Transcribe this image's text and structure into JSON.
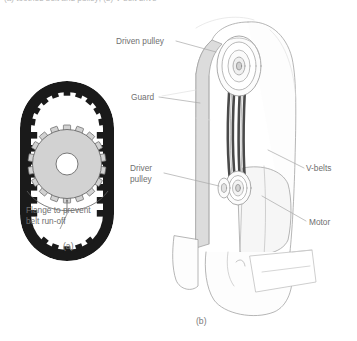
{
  "figure": {
    "top_caption": "(a) toothed belt and pulley; (b) V-belt drive",
    "panel_a": {
      "sublabel": "(a)",
      "annotation_line1": "Flange to prevent",
      "annotation_line2": "belt run-off",
      "parts": {
        "belt": "toothed-belt",
        "pulley": "toothed-pulley",
        "bore": "center-bore"
      },
      "tooth_count_belt": 26,
      "tooth_count_pulley": 18
    },
    "panel_b": {
      "sublabel": "(b)",
      "labels": {
        "driven_pulley": "Driven pulley",
        "guard": "Guard",
        "driver_pulley_line1": "Driver",
        "driver_pulley_line2": "pulley",
        "v_belts": "V-belts",
        "motor": "Motor"
      },
      "belt_count": 4
    }
  },
  "colors": {
    "belt_black": "#1a1a1a",
    "pulley_gray": "#d4d4d4",
    "pulley_edge": "#6a6a6a",
    "bore_white": "#ffffff",
    "line_gray": "#9a9a9a",
    "guard_gray": "#d8d8d8",
    "motor_gray": "#f2f2f2",
    "text_gray": "#6f6f6f",
    "leader_gray": "#a5a5a5"
  }
}
